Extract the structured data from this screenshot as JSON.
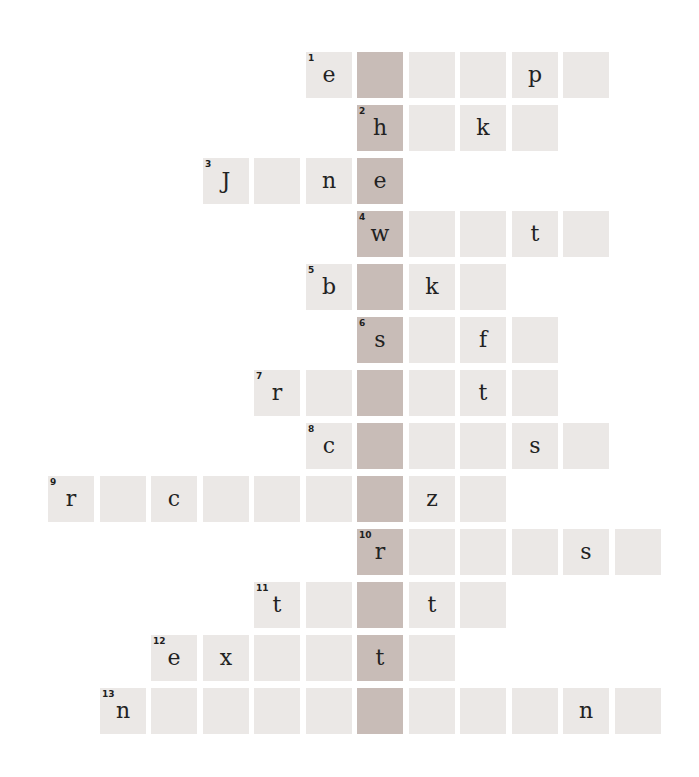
{
  "puzzle": {
    "type": "crossword",
    "highlight_column": 6,
    "colors": {
      "cell": "#ebe8e6",
      "key_cell": "#c8bcb7",
      "text": "#222222",
      "background": "#ffffff"
    },
    "rows": [
      {
        "number": "1",
        "start_col": 5,
        "cells": [
          "e",
          "",
          "",
          "",
          "p",
          ""
        ]
      },
      {
        "number": "2",
        "start_col": 6,
        "cells": [
          "h",
          "",
          "k",
          ""
        ]
      },
      {
        "number": "3",
        "start_col": 3,
        "cells": [
          "J",
          "",
          "n",
          "e"
        ]
      },
      {
        "number": "4",
        "start_col": 6,
        "cells": [
          "w",
          "",
          "",
          "t",
          ""
        ]
      },
      {
        "number": "5",
        "start_col": 5,
        "cells": [
          "b",
          "",
          "k",
          ""
        ]
      },
      {
        "number": "6",
        "start_col": 6,
        "cells": [
          "s",
          "",
          "f",
          ""
        ]
      },
      {
        "number": "7",
        "start_col": 4,
        "cells": [
          "r",
          "",
          "",
          "",
          "t",
          ""
        ]
      },
      {
        "number": "8",
        "start_col": 5,
        "cells": [
          "c",
          "",
          "",
          "",
          "s",
          ""
        ]
      },
      {
        "number": "9",
        "start_col": 0,
        "cells": [
          "r",
          "",
          "c",
          "",
          "",
          "",
          "",
          "z",
          ""
        ]
      },
      {
        "number": "10",
        "start_col": 6,
        "cells": [
          "r",
          "",
          "",
          "",
          "s",
          ""
        ]
      },
      {
        "number": "11",
        "start_col": 4,
        "cells": [
          "t",
          "",
          "",
          "t",
          ""
        ]
      },
      {
        "number": "12",
        "start_col": 2,
        "cells": [
          "e",
          "x",
          "",
          "",
          "t",
          ""
        ]
      },
      {
        "number": "13",
        "start_col": 1,
        "cells": [
          "n",
          "",
          "",
          "",
          "",
          "",
          "",
          "",
          "",
          "n",
          ""
        ]
      }
    ]
  }
}
